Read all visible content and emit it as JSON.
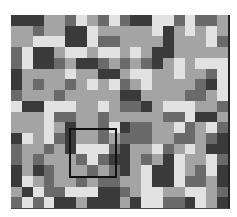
{
  "palette": {
    "0": "#3a3a3a",
    "1": "#6a6a6a",
    "2": "#a4a4a4",
    "3": "#e2e2e2"
  },
  "grid": {
    "cols": 20,
    "rows": 18,
    "cells": [
      [
        0,
        0,
        0,
        2,
        2,
        1,
        3,
        2,
        1,
        3,
        1,
        0,
        0,
        3,
        3,
        1,
        3,
        1,
        1,
        2
      ],
      [
        2,
        2,
        1,
        2,
        2,
        0,
        0,
        3,
        2,
        2,
        2,
        2,
        2,
        3,
        0,
        2,
        3,
        2,
        3,
        2
      ],
      [
        2,
        2,
        3,
        3,
        3,
        0,
        0,
        3,
        1,
        1,
        2,
        2,
        2,
        2,
        0,
        2,
        2,
        2,
        3,
        1
      ],
      [
        1,
        3,
        0,
        0,
        2,
        3,
        3,
        2,
        3,
        3,
        2,
        3,
        2,
        0,
        0,
        2,
        2,
        2,
        2,
        2
      ],
      [
        1,
        3,
        0,
        0,
        1,
        2,
        0,
        0,
        1,
        2,
        1,
        2,
        1,
        0,
        2,
        3,
        2,
        3,
        3,
        3
      ],
      [
        0,
        2,
        2,
        2,
        2,
        3,
        2,
        2,
        0,
        0,
        2,
        3,
        3,
        2,
        2,
        3,
        2,
        2,
        1,
        3
      ],
      [
        0,
        2,
        1,
        2,
        2,
        1,
        2,
        3,
        2,
        3,
        1,
        2,
        3,
        2,
        2,
        2,
        2,
        1,
        0,
        3
      ],
      [
        1,
        2,
        2,
        2,
        1,
        2,
        2,
        2,
        2,
        2,
        0,
        0,
        2,
        2,
        2,
        2,
        1,
        1,
        2,
        3
      ],
      [
        3,
        0,
        0,
        3,
        3,
        3,
        2,
        2,
        3,
        2,
        1,
        1,
        0,
        2,
        3,
        3,
        3,
        2,
        2,
        1
      ],
      [
        2,
        2,
        2,
        3,
        1,
        1,
        2,
        2,
        1,
        2,
        2,
        2,
        2,
        2,
        1,
        1,
        3,
        0,
        0,
        2
      ],
      [
        2,
        2,
        2,
        3,
        2,
        0,
        2,
        2,
        1,
        3,
        0,
        1,
        1,
        2,
        2,
        3,
        1,
        2,
        3,
        1
      ],
      [
        0,
        3,
        2,
        3,
        1,
        0,
        2,
        2,
        1,
        2,
        1,
        1,
        1,
        2,
        2,
        1,
        1,
        2,
        1,
        0
      ],
      [
        1,
        2,
        2,
        1,
        2,
        0,
        3,
        3,
        3,
        1,
        0,
        2,
        2,
        3,
        1,
        2,
        3,
        2,
        0,
        0
      ],
      [
        1,
        2,
        1,
        2,
        2,
        2,
        1,
        3,
        1,
        0,
        0,
        2,
        1,
        2,
        0,
        3,
        2,
        2,
        3,
        1
      ],
      [
        0,
        2,
        0,
        1,
        2,
        2,
        2,
        1,
        2,
        1,
        0,
        2,
        3,
        0,
        0,
        3,
        2,
        1,
        3,
        0
      ],
      [
        0,
        3,
        2,
        1,
        2,
        2,
        1,
        2,
        1,
        1,
        2,
        2,
        3,
        0,
        0,
        3,
        1,
        1,
        2,
        0
      ],
      [
        2,
        0,
        3,
        1,
        1,
        3,
        3,
        3,
        0,
        0,
        1,
        2,
        3,
        3,
        2,
        2,
        3,
        3,
        2,
        1
      ],
      [
        1,
        3,
        1,
        3,
        0,
        0,
        2,
        0,
        0,
        0,
        2,
        0,
        3,
        3,
        1,
        1,
        0,
        3,
        2,
        0
      ]
    ]
  },
  "selection": {
    "label": "selected-region"
  }
}
